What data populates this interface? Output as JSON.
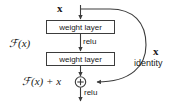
{
  "diagram": {
    "background_color": "#ffffff",
    "stroke_color": "#3c3c3c",
    "text_color": "#1a1a1a",
    "input": {
      "label": "x",
      "description": "input tensor entering the residual block"
    },
    "blocks": [
      {
        "id": "weight-layer-1",
        "label": "weight layer"
      },
      {
        "id": "weight-layer-2",
        "label": "weight layer"
      }
    ],
    "activations": [
      {
        "id": "relu-1",
        "label": "relu",
        "position": "between weight layers"
      },
      {
        "id": "relu-2",
        "label": "relu",
        "position": "after addition"
      }
    ],
    "branch_label": {
      "function": "F(x)",
      "function_math": "ℱ(x)"
    },
    "output_label": {
      "sum": "F(x) + x",
      "sum_math": "ℱ(x) + x"
    },
    "shortcut": {
      "symbol": "x",
      "label": "identity"
    },
    "operator": {
      "symbol": "+",
      "name": "element-wise-addition"
    }
  }
}
